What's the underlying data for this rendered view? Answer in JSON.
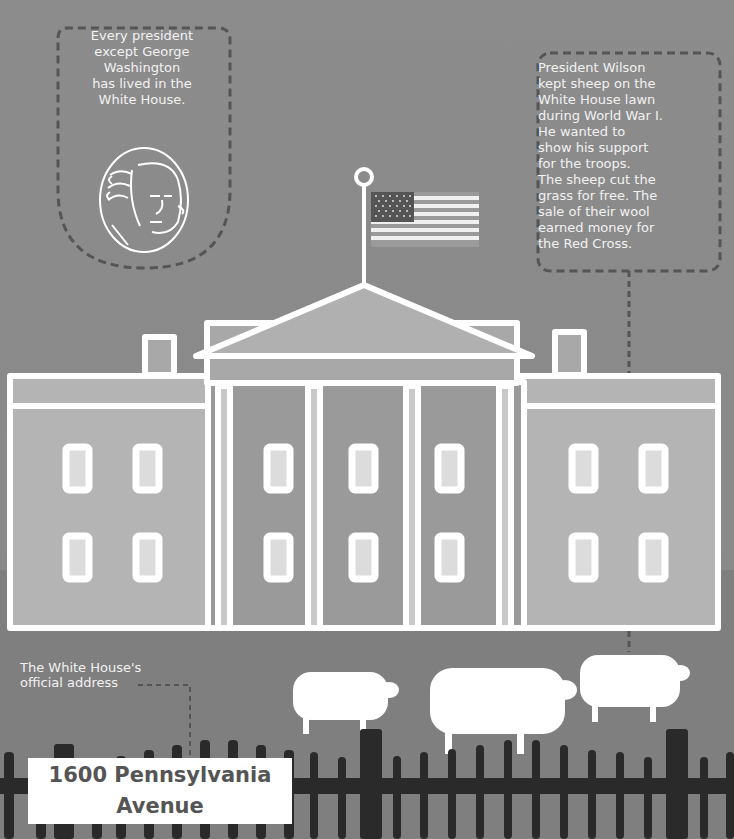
{
  "colors": {
    "sky": "#8a8a8a",
    "outline": "#ffffff",
    "wing_fill": "#b4b4b4",
    "portico_fill": "#9a9a9a",
    "window_glass": "#dcdcdc",
    "fence": "#2a2a2a",
    "dashed_line": "#555555",
    "address_text": "#555555"
  },
  "callouts": {
    "washington": {
      "lines": [
        "Every president",
        "except George",
        "Washington",
        "has lived in the",
        "White House."
      ],
      "icon": "george-washington-portrait"
    },
    "wilson": {
      "lines": [
        "President Wilson",
        "kept sheep on the",
        "White House lawn",
        "during World War I.",
        "He wanted to",
        "show his support",
        "for the troops.",
        "The sheep cut the",
        "grass for free. The",
        "sale of their wool",
        "earned money for",
        "the Red Cross."
      ]
    },
    "address_label": {
      "lines": [
        "The White House's",
        "official address"
      ]
    }
  },
  "address_sign": {
    "line1": "1600 Pennsylvania",
    "line2": "Avenue"
  },
  "illustration": {
    "building": "white-house",
    "flag": "us-flag",
    "sheep_count": 3,
    "windows_per_row": 8,
    "window_rows": 2
  }
}
